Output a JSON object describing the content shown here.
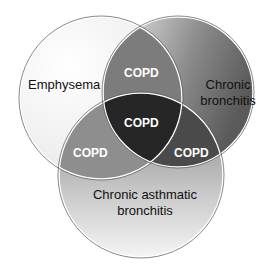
{
  "sets": {
    "emphysema": {
      "label": "Emphysema"
    },
    "chronic_bronchitis": {
      "label_line1": "Chronic",
      "label_line2": "bronchitis"
    },
    "chronic_asthmatic_bronchitis": {
      "label_line1": "Chronic asthmatic",
      "label_line2": "bronchitis"
    }
  },
  "overlaps": {
    "top": "COPD",
    "center": "COPD",
    "left": "COPD",
    "right": "COPD"
  },
  "colors": {
    "outline": "#ffffff",
    "edge": "#555555",
    "center": "#262626"
  }
}
